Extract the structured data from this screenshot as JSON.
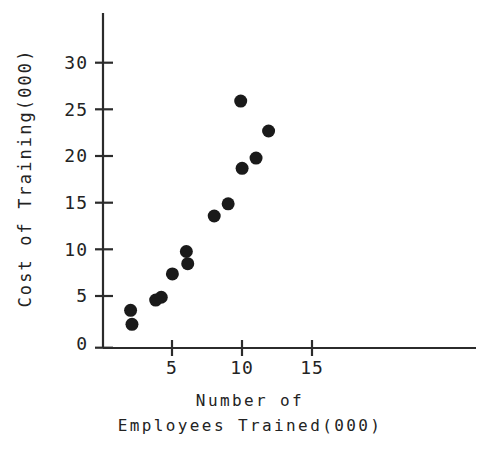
{
  "chart_data": {
    "type": "scatter",
    "title": "",
    "subtitle": "",
    "xlabel_line1": "Number of",
    "xlabel_line2": "Employees Trained(000)",
    "xlabel": "Number of Employees Trained(000)",
    "ylabel": "Cost of Training(000)",
    "xlim": [
      0,
      17.5
    ],
    "ylim": [
      0,
      35.8
    ],
    "xticks": [
      5,
      10,
      15
    ],
    "xtick_labels": [
      "5",
      "10",
      "15"
    ],
    "yticks": [
      0,
      5,
      10,
      15,
      20,
      25,
      30
    ],
    "ytick_labels": [
      "0",
      "5",
      "10",
      "15",
      "20",
      "25",
      "30"
    ],
    "grid": false,
    "legend": null,
    "marker": "filled-circle",
    "marker_color": "#1a1a1a",
    "marker_size": 6.5,
    "axis_color": "#2b2b2b",
    "background": "#ffffff",
    "x": [
      2.0,
      2.1,
      3.8,
      4.2,
      5.0,
      6.0,
      6.1,
      8.0,
      9.0,
      9.9,
      10.0,
      11.0,
      11.9
    ],
    "y": [
      4.0,
      2.5,
      5.1,
      5.4,
      7.9,
      10.3,
      9.0,
      14.1,
      15.4,
      26.4,
      19.2,
      20.3,
      23.2
    ],
    "points": [
      {
        "x": 2.0,
        "y": 4.0
      },
      {
        "x": 2.1,
        "y": 2.5
      },
      {
        "x": 3.8,
        "y": 5.1
      },
      {
        "x": 4.2,
        "y": 5.4
      },
      {
        "x": 5.0,
        "y": 7.9
      },
      {
        "x": 6.0,
        "y": 10.3
      },
      {
        "x": 6.1,
        "y": 9.0
      },
      {
        "x": 8.0,
        "y": 14.1
      },
      {
        "x": 9.0,
        "y": 15.4
      },
      {
        "x": 9.9,
        "y": 26.4
      },
      {
        "x": 10.0,
        "y": 19.2
      },
      {
        "x": 11.0,
        "y": 20.3
      },
      {
        "x": 11.9,
        "y": 23.2
      }
    ]
  },
  "axes": {
    "y_title": "Cost of Training(000)",
    "x_title_line1": "Number of",
    "x_title_line2": "Employees Trained(000)",
    "y_tick_labels": [
      "30",
      "25",
      "20",
      "15",
      "10",
      "5",
      "0"
    ],
    "x_tick_labels": [
      "5",
      "10",
      "15"
    ]
  }
}
